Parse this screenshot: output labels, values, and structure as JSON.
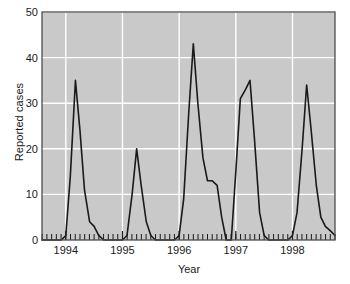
{
  "chart_data": {
    "type": "line",
    "title": "",
    "xlabel": "Year",
    "ylabel": "Reported cases",
    "xlim": [
      1993.58,
      1998.75
    ],
    "ylim": [
      0,
      50
    ],
    "yticks": [
      0,
      10,
      20,
      30,
      40,
      50
    ],
    "xticks": [
      1994,
      1995,
      1996,
      1997,
      1998
    ],
    "xtick_labels": [
      "1994",
      "1995",
      "1996",
      "1997",
      "1998"
    ],
    "ytick_labels": [
      "0",
      "10",
      "20",
      "30",
      "40",
      "50"
    ],
    "grid": true,
    "grid_color": "#ffffff",
    "plot_background": "#c9c9c9",
    "line_color": "#1a1a1a",
    "minor_xticks": "monthly",
    "series": [
      {
        "name": "Reported cases",
        "x": [
          1993.58,
          1993.67,
          1993.75,
          1993.83,
          1993.92,
          1994.0,
          1994.08,
          1994.17,
          1994.25,
          1994.33,
          1994.42,
          1994.5,
          1994.58,
          1994.67,
          1994.75,
          1994.83,
          1994.92,
          1995.0,
          1995.08,
          1995.17,
          1995.25,
          1995.33,
          1995.42,
          1995.5,
          1995.58,
          1995.67,
          1995.75,
          1995.83,
          1995.92,
          1996.0,
          1996.08,
          1996.17,
          1996.25,
          1996.33,
          1996.42,
          1996.5,
          1996.58,
          1996.67,
          1996.75,
          1996.83,
          1996.92,
          1997.0,
          1997.08,
          1997.17,
          1997.25,
          1997.33,
          1997.42,
          1997.5,
          1997.58,
          1997.67,
          1997.75,
          1997.83,
          1997.92,
          1998.0,
          1998.08,
          1998.17,
          1998.25,
          1998.33,
          1998.42,
          1998.5,
          1998.58,
          1998.67,
          1998.75
        ],
        "values": [
          0,
          0,
          0,
          0,
          0,
          1,
          14,
          35,
          24,
          11,
          4,
          3,
          1,
          0,
          0,
          0,
          0,
          0,
          1,
          10,
          20,
          12,
          4,
          1,
          0,
          0,
          0,
          0,
          0,
          1,
          9,
          28,
          43,
          30,
          18,
          13,
          13,
          12,
          5,
          0,
          0,
          15,
          31,
          33,
          35,
          22,
          6,
          1,
          0,
          0,
          0,
          0,
          0,
          1,
          6,
          20,
          34,
          24,
          12,
          5,
          3,
          2,
          1
        ]
      }
    ]
  }
}
